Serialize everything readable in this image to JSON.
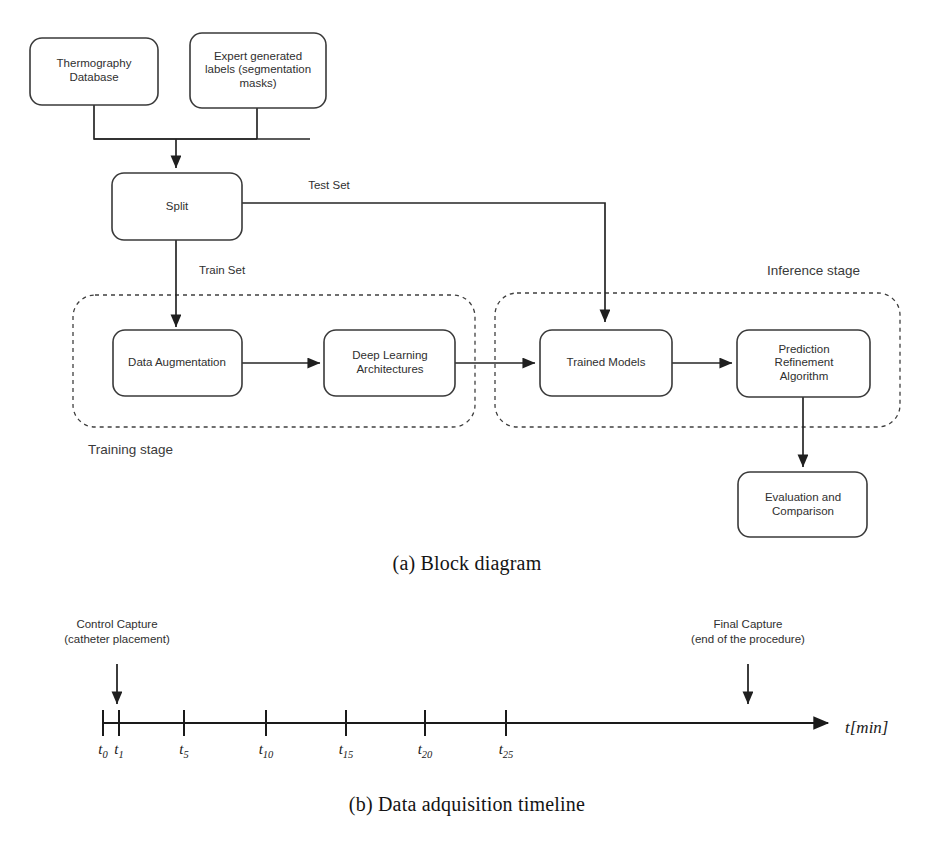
{
  "figure": {
    "caption_a": "(a) Block diagram",
    "caption_b": "(b) Data adquisition timeline"
  },
  "block_diagram": {
    "nodes": [
      {
        "id": "thermography_database",
        "label": "Thermography\nDatabase"
      },
      {
        "id": "expert_labels",
        "label": "Expert generated\nlabels (segmentation\nmasks)"
      },
      {
        "id": "split",
        "label": "Split"
      },
      {
        "id": "data_augmentation",
        "label": "Data Augmentation"
      },
      {
        "id": "deep_learning",
        "label": "Deep Learning\nArchitectures"
      },
      {
        "id": "trained_models",
        "label": "Trained Models"
      },
      {
        "id": "prediction_refinement",
        "label": "Prediction\nRefinement\nAlgorithm"
      },
      {
        "id": "evaluation",
        "label": "Evaluation and\nComparison"
      }
    ],
    "edge_labels": {
      "test_set": "Test Set",
      "train_set": "Train Set"
    },
    "stages": {
      "training": "Training stage",
      "inference": "Inference stage"
    },
    "colors": {
      "box_stroke": "#3a3a3a",
      "edge_stroke": "#262626",
      "dashed_stroke": "#3f3f3f",
      "text": "#2f2f2f",
      "background": "#ffffff"
    }
  },
  "timeline": {
    "axis_title_main": "t",
    "axis_title_unit": "[min]",
    "ticks": [
      {
        "base": "t",
        "sub": "0",
        "x": 103
      },
      {
        "base": "t",
        "sub": "1",
        "x": 119
      },
      {
        "base": "t",
        "sub": "5",
        "x": 184
      },
      {
        "base": "t",
        "sub": "10",
        "x": 266
      },
      {
        "base": "t",
        "sub": "15",
        "x": 346
      },
      {
        "base": "t",
        "sub": "20",
        "x": 425
      },
      {
        "base": "t",
        "sub": "25",
        "x": 506
      }
    ],
    "callouts": [
      {
        "id": "control_capture",
        "line1": "Control Capture",
        "line2": "(catheter placement)",
        "x": 117
      },
      {
        "id": "final_capture",
        "line1": "Final Capture",
        "line2": "(end of the procedure)",
        "x": 748
      }
    ]
  }
}
